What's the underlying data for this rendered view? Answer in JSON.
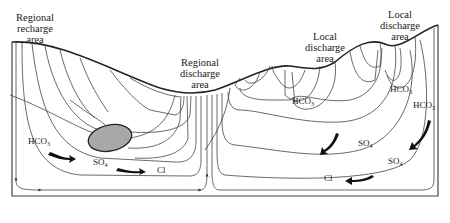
{
  "figure": {
    "type": "groundwater flow system cross-section",
    "region_labels": [
      {
        "id": "regional-recharge",
        "lines": [
          "Regional",
          "recharge",
          "area"
        ]
      },
      {
        "id": "regional-discharge",
        "lines": [
          "Regional",
          "discharge",
          "area"
        ]
      },
      {
        "id": "local-discharge-1",
        "lines": [
          "Local",
          "discharge",
          "area"
        ]
      },
      {
        "id": "local-discharge-2",
        "lines": [
          "Local",
          "discharge",
          "area"
        ]
      }
    ],
    "chemistry_labels": {
      "left_hco3": {
        "base": "HCO",
        "sub": "3"
      },
      "left_so4": {
        "base": "SO",
        "sub": "4"
      },
      "left_cl": {
        "base": "Cl",
        "sub": ""
      },
      "mid_hco3": {
        "base": "HCO",
        "sub": "3"
      },
      "right_hco3_a": {
        "base": "HCO",
        "sub": "3"
      },
      "right_hco3_b": {
        "base": "HCO",
        "sub": "3"
      },
      "right_so4_a": {
        "base": "SO",
        "sub": "4"
      },
      "right_so4_b": {
        "base": "SO",
        "sub": "4"
      },
      "right_cl": {
        "base": "Cl",
        "sub": ""
      }
    },
    "evolution_sequence": [
      "HCO3",
      "SO4",
      "Cl"
    ],
    "lens_fill": "#a8a8a8",
    "line_color": "#333333"
  }
}
